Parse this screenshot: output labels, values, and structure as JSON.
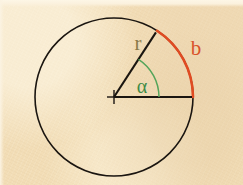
{
  "figure": {
    "background_color": "#f2ddb6",
    "width": 243,
    "height": 185
  },
  "geometry": {
    "center": {
      "x": 114,
      "y": 97,
      "label": "circle-center"
    },
    "radius": 79,
    "circle_color": "#1a1510",
    "circle_stroke_width": 1.6,
    "angle_start_deg": 0,
    "angle_end_deg": 57,
    "arc_highlight_end_deg": 57,
    "angle_arc_radius": 45,
    "center_marker_size": 7
  },
  "labels": {
    "radius": {
      "text": "r",
      "color": "#8a7a48",
      "x": 138,
      "y": 50,
      "size": 21
    },
    "arc": {
      "text": "b",
      "color": "#d9532a",
      "x": 196,
      "y": 55,
      "size": 21
    },
    "angle": {
      "text": "α",
      "color": "#3f8a45",
      "x": 142,
      "y": 93,
      "size": 20
    }
  },
  "colors": {
    "ink": "#1a1510",
    "arc_highlight": "#e04b22",
    "angle_arc": "#54a45a",
    "radius_label": "#8a7a48",
    "paper": "#f2ddb6"
  },
  "elements": {
    "circle": "circle-outline",
    "radius_line": "radius-segment",
    "baseline": "horizontal-radius-segment",
    "highlight_arc": "arc-length-b",
    "angle_arc": "angle-alpha-arc",
    "center_cross": "center-cross-marker"
  }
}
